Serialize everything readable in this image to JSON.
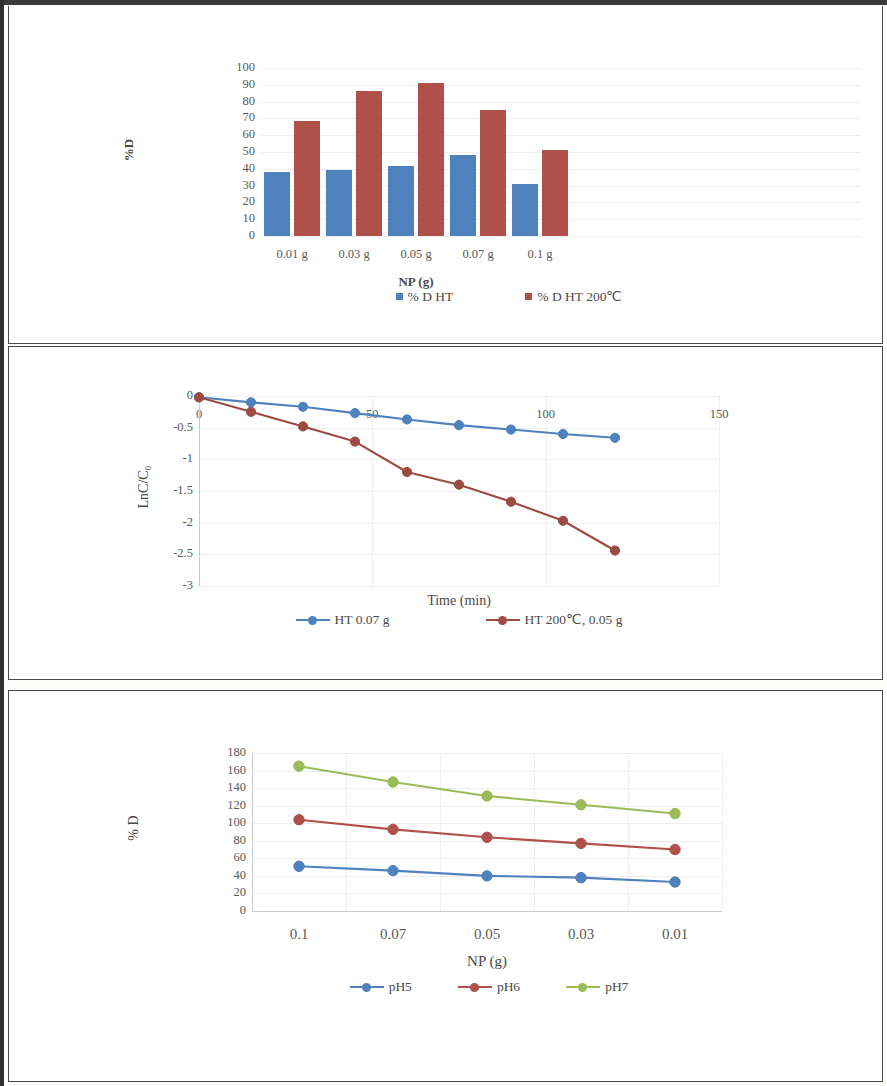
{
  "document": {
    "kind": "scanned-figure-page",
    "panel_count": 3
  },
  "panel1": {
    "name": "bar-chart-percent-degradation-vs-np",
    "legend": [
      {
        "label": "% D HT",
        "color": "#4F81BD"
      },
      {
        "label": "% D HT 200℃",
        "color": "#B0504B"
      }
    ],
    "chart_data": {
      "type": "bar",
      "title": "",
      "categories": [
        "0.01 g",
        "0.03 g",
        "0.05 g",
        "0.07 g",
        "0.1 g"
      ],
      "series": [
        {
          "name": "% D HT",
          "color": "#4F81BD",
          "values": [
            38,
            39.5,
            41.5,
            48.5,
            31
          ]
        },
        {
          "name": "% D HT 200℃",
          "color": "#B0504B",
          "values": [
            68.5,
            86.5,
            91,
            75,
            51
          ]
        }
      ],
      "xlabel": "NP (g)",
      "ylabel": "%D",
      "ylim": [
        0,
        100
      ],
      "yticks": [
        0,
        10,
        20,
        30,
        40,
        50,
        60,
        70,
        80,
        90,
        100
      ],
      "grid": true,
      "legend_position": "bottom"
    }
  },
  "panel2": {
    "name": "line-chart-kinetics-lnc-c0-vs-time",
    "legend": [
      {
        "label": "HT 0.07 g",
        "color": "#4F81BD"
      },
      {
        "label": "HT 200℃, 0.05 g",
        "color": "#9C4B43"
      }
    ],
    "chart_data": {
      "type": "line",
      "title": "",
      "x": [
        0,
        15,
        30,
        45,
        60,
        75,
        90,
        105,
        120
      ],
      "series": [
        {
          "name": "HT 0.07 g",
          "color": "#4F81BD",
          "values": [
            -0.02,
            -0.1,
            -0.17,
            -0.27,
            -0.37,
            -0.46,
            -0.53,
            -0.6,
            -0.66
          ]
        },
        {
          "name": "HT 200℃, 0.05 g",
          "color": "#9C4B43",
          "values": [
            -0.02,
            -0.25,
            -0.48,
            -0.72,
            -1.2,
            -1.4,
            -1.67,
            -1.97,
            -2.44
          ]
        }
      ],
      "xlabel": "Time (min)",
      "ylabel": "LnC/C₀",
      "xlim": [
        0,
        150
      ],
      "xticks": [
        0,
        50,
        100,
        150
      ],
      "ylim": [
        -3,
        0
      ],
      "yticks": [
        0,
        -0.5,
        -1,
        -1.5,
        -2,
        -2.5,
        -3
      ],
      "grid": true,
      "legend_position": "bottom"
    }
  },
  "panel3": {
    "name": "line-chart-percent-degradation-vs-np-by-ph",
    "legend": [
      {
        "label": "pH5",
        "color": "#4F81BD"
      },
      {
        "label": "pH6",
        "color": "#B0504B"
      },
      {
        "label": "pH7",
        "color": "#9BBB59"
      }
    ],
    "chart_data": {
      "type": "line",
      "title": "",
      "categories": [
        "0.1",
        "0.07",
        "0.05",
        "0.03",
        "0.01"
      ],
      "series": [
        {
          "name": "pH5",
          "color": "#4F81BD",
          "values": [
            51,
            46,
            40,
            38,
            33
          ]
        },
        {
          "name": "pH6",
          "color": "#B0504B",
          "values": [
            104,
            93,
            84,
            77,
            70
          ]
        },
        {
          "name": "pH7",
          "color": "#9BBB59",
          "values": [
            165,
            147,
            131,
            121,
            111
          ]
        }
      ],
      "xlabel": "NP (g)",
      "ylabel": "% D",
      "ylim": [
        0,
        180
      ],
      "yticks": [
        0,
        20,
        40,
        60,
        80,
        100,
        120,
        140,
        160,
        180
      ],
      "grid": true,
      "legend_position": "bottom"
    }
  }
}
